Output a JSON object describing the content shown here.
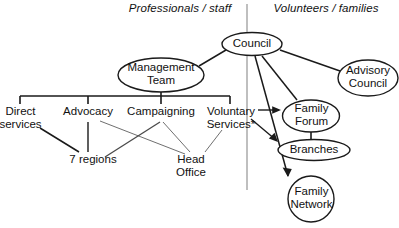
{
  "diagram": {
    "type": "organisation-structure-chart",
    "divider": {
      "orientation": "vertical",
      "x": 247,
      "from_y": 4,
      "to_y": 190,
      "color": "#8a8a8a"
    },
    "headers": [
      {
        "id": "professionals",
        "label": "Professionals / staff",
        "side": "left"
      },
      {
        "id": "volunteers",
        "label": "Volunteers / families",
        "side": "right"
      }
    ],
    "ellipse_nodes": [
      {
        "id": "council",
        "label": "Council",
        "shape": "ellipse"
      },
      {
        "id": "management-team",
        "label": "Management\nTeam",
        "shape": "ellipse"
      },
      {
        "id": "advisory-council",
        "label": "Advisory\nCouncil",
        "shape": "ellipse"
      },
      {
        "id": "family-forum",
        "label": "Family\nForum",
        "shape": "ellipse"
      },
      {
        "id": "branches",
        "label": "Branches",
        "shape": "ellipse"
      },
      {
        "id": "family-network",
        "label": "Family\nNetwork",
        "shape": "circle"
      }
    ],
    "plain_nodes": [
      {
        "id": "direct-services",
        "label": "Direct\nservices"
      },
      {
        "id": "advocacy",
        "label": "Advocacy"
      },
      {
        "id": "campaigning",
        "label": "Campaigning"
      },
      {
        "id": "voluntary-services",
        "label": "Voluntary\nServices*"
      },
      {
        "id": "seven-regions",
        "label": "7 regions"
      },
      {
        "id": "head-office",
        "label": "Head\nOffice"
      }
    ],
    "edges": [
      {
        "from": "council",
        "to": "management-team",
        "arrow": false
      },
      {
        "from": "council",
        "to": "advisory-council",
        "arrow": false
      },
      {
        "from": "council",
        "to": "family-forum",
        "arrow": false
      },
      {
        "from": "council",
        "to": "family-network",
        "arrow": true
      },
      {
        "from": "management-team",
        "to": "branch-bar",
        "arrow": false
      },
      {
        "from": "branch-bar",
        "to": "direct-services",
        "arrow": false
      },
      {
        "from": "branch-bar",
        "to": "advocacy",
        "arrow": false
      },
      {
        "from": "branch-bar",
        "to": "campaigning",
        "arrow": false
      },
      {
        "from": "branch-bar",
        "to": "voluntary-services",
        "arrow": false
      },
      {
        "from": "direct-services",
        "to": "seven-regions",
        "arrow": false
      },
      {
        "from": "advocacy",
        "to": "seven-regions",
        "arrow": false
      },
      {
        "from": "advocacy",
        "to": "head-office",
        "arrow": false
      },
      {
        "from": "campaigning",
        "to": "seven-regions",
        "arrow": false
      },
      {
        "from": "campaigning",
        "to": "head-office",
        "arrow": false
      },
      {
        "from": "voluntary-services",
        "to": "head-office",
        "arrow": false
      },
      {
        "from": "voluntary-services",
        "to": "family-forum",
        "arrow": true
      },
      {
        "from": "voluntary-services",
        "to": "branches",
        "arrow": true
      },
      {
        "from": "family-forum",
        "to": "branches",
        "arrow": false
      }
    ],
    "colors": {
      "ink": "#111111",
      "stroke": "#1a1a1a",
      "thin_stroke": "#6f6f6f",
      "divider": "#8a8a8a",
      "background": "#ffffff"
    }
  }
}
